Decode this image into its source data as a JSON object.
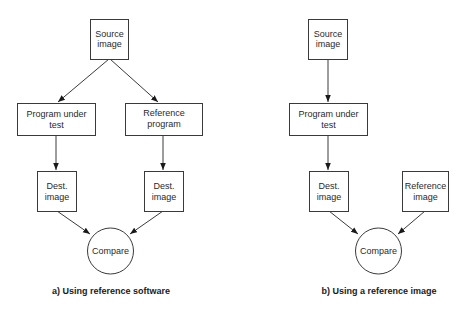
{
  "diagrams": [
    {
      "id": "a",
      "caption": "a) Using reference software",
      "nodes": {
        "source": {
          "line1": "Source",
          "line2": "image"
        },
        "program": {
          "line1": "Program under",
          "line2": "test"
        },
        "reference": {
          "line1": "Reference",
          "line2": "program"
        },
        "dest1": {
          "line1": "Dest.",
          "line2": "image"
        },
        "dest2": {
          "line1": "Dest.",
          "line2": "image"
        },
        "compare": {
          "label": "Compare"
        }
      },
      "edges": [
        [
          "source",
          "program"
        ],
        [
          "source",
          "reference"
        ],
        [
          "program",
          "dest1"
        ],
        [
          "reference",
          "dest2"
        ],
        [
          "dest1",
          "compare"
        ],
        [
          "dest2",
          "compare"
        ]
      ]
    },
    {
      "id": "b",
      "caption": "b) Using a reference image",
      "nodes": {
        "source": {
          "line1": "Source",
          "line2": "image"
        },
        "program": {
          "line1": "Program under",
          "line2": "test"
        },
        "dest": {
          "line1": "Dest.",
          "line2": "image"
        },
        "refimage": {
          "line1": "Reference",
          "line2": "image"
        },
        "compare": {
          "label": "Compare"
        }
      },
      "edges": [
        [
          "source",
          "program"
        ],
        [
          "program",
          "dest"
        ],
        [
          "dest",
          "compare"
        ],
        [
          "refimage",
          "compare"
        ]
      ]
    }
  ]
}
